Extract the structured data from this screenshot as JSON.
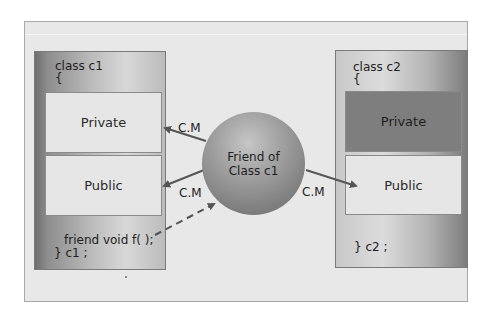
{
  "diagram": {
    "class_c1": {
      "header": "class c1",
      "open_brace": "{",
      "private_label": "Private",
      "public_label": "Public",
      "friend_decl": "friend void f( );",
      "close": "} c1 ;"
    },
    "class_c2": {
      "header": "class c2",
      "open_brace": "{",
      "private_label": "Private",
      "public_label": "Public",
      "close": "} c2 ;"
    },
    "friend_node": {
      "line1": "Friend of",
      "line2": "Class c1"
    },
    "arrow_labels": {
      "to_c1_private": "C.M",
      "to_c1_public": "C.M",
      "to_c2_public": "C.M"
    },
    "colors": {
      "arrow": "#555555",
      "panel_bg": "#e8e8e8",
      "private_c2_bg": "#7e7e7e"
    }
  }
}
